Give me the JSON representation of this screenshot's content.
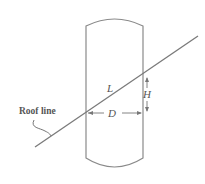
{
  "diagram": {
    "labels": {
      "roof_line": "Roof line",
      "L": "L",
      "D": "D",
      "H": "H"
    },
    "colors": {
      "stroke": "#7a7a7a",
      "text": "#555555",
      "background": "#ffffff"
    }
  }
}
